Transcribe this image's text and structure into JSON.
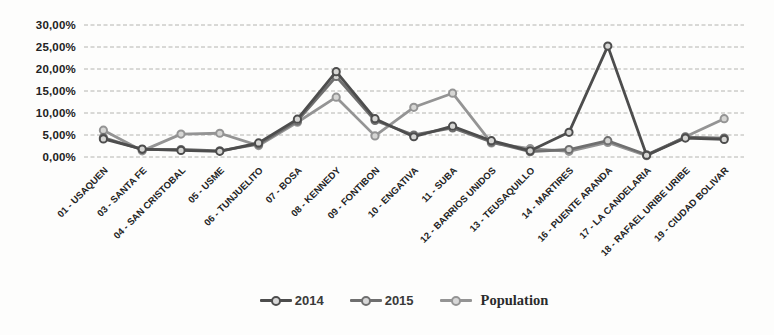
{
  "chart_data": {
    "type": "line",
    "title": "",
    "xlabel": "",
    "ylabel": "",
    "ylim": [
      0,
      30
    ],
    "ytick_step": 5,
    "ytick_labels": [
      "0,00%",
      "5,00%",
      "10,00%",
      "15,00%",
      "20,00%",
      "25,00%",
      "30,00%"
    ],
    "grid": true,
    "gridline_color": "#b4b4b0",
    "marker_fill": "#d6d6d4",
    "legend_position": "bottom",
    "categories": [
      "01 - USAQUEN",
      "03 - SANTA FE",
      "04 - SAN CRISTOBAL",
      "05 - USME",
      "06 - TUNJUELITO",
      "07 - BOSA",
      "08 - KENNEDY",
      "09 - FONTIBON",
      "10 - ENGATIVA",
      "11 - SUBA",
      "12 - BARRIOS UNIDOS",
      "13 - TEUSAQUILLO",
      "14 - MARTIRES",
      "16 - PUENTE ARANDA",
      "17 - LA CANDELARIA",
      "18 - RAFAEL URIBE URIBE",
      "19 - CIUDAD BOLIVAR"
    ],
    "series": [
      {
        "name": "2014",
        "color": "#4d4d4d",
        "values": [
          4.1,
          1.8,
          1.5,
          1.3,
          3.2,
          8.6,
          19.4,
          8.7,
          4.6,
          7.0,
          3.7,
          1.4,
          5.6,
          25.2,
          0.4,
          4.3,
          4.0
        ]
      },
      {
        "name": "2015",
        "color": "#6f6f6f",
        "values": [
          4.4,
          1.7,
          1.7,
          1.4,
          2.9,
          8.2,
          18.3,
          8.3,
          5.0,
          6.6,
          3.4,
          1.2,
          1.7,
          3.7,
          0.5,
          4.5,
          4.3
        ]
      },
      {
        "name": "Population",
        "color": "#949494",
        "values": [
          6.1,
          1.4,
          5.2,
          5.4,
          2.6,
          7.9,
          13.6,
          4.8,
          11.3,
          14.5,
          3.2,
          1.9,
          1.3,
          3.3,
          0.3,
          4.6,
          8.7
        ]
      }
    ]
  }
}
